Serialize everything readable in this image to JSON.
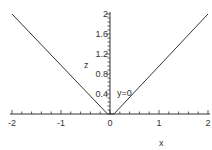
{
  "chart_data": {
    "type": "line",
    "title": "",
    "xlabel": "x",
    "ylabel": "z",
    "annotation": "y=0",
    "xlim": [
      -2,
      2
    ],
    "ylim": [
      0,
      2
    ],
    "x_ticks": [
      "-2",
      "-1",
      "0",
      "1",
      "2"
    ],
    "x_tick_values": [
      -2,
      -1,
      0,
      1,
      2
    ],
    "y_ticks": [
      "0.4",
      "0.8",
      "1.2",
      "1.6",
      "2"
    ],
    "y_tick_values": [
      0.4,
      0.8,
      1.2,
      1.6,
      2
    ],
    "grid": false,
    "series": [
      {
        "name": "z",
        "x": [
          -2,
          -0.05,
          0.08,
          2
        ],
        "y": [
          2,
          0,
          0,
          2
        ]
      }
    ],
    "colors": {
      "line": "#333333",
      "axis": "#333333"
    }
  }
}
